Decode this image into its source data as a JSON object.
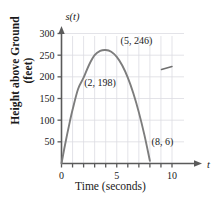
{
  "chart_data": {
    "type": "line",
    "title": "",
    "xlabel": "Time (seconds)",
    "ylabel": "Height above Ground (feet)",
    "y_axis_name": "s(t)",
    "x_axis_name": "t",
    "xlim": [
      0,
      11
    ],
    "ylim": [
      0,
      320
    ],
    "xticks": [
      0,
      1,
      2,
      3,
      4,
      5,
      6,
      7,
      8,
      9,
      10
    ],
    "xtick_labels": [
      "0",
      "",
      "",
      "",
      "",
      "5",
      "",
      "",
      "",
      "",
      "10"
    ],
    "yticks": [
      50,
      100,
      150,
      200,
      250,
      300
    ],
    "ytick_labels": [
      "50",
      "100",
      "150",
      "200",
      "250",
      "300"
    ],
    "grid": true,
    "legend": "none",
    "series": [
      {
        "name": "s(t)",
        "color": "#7d7d7d",
        "x": [
          0,
          0.25,
          0.5,
          0.75,
          1,
          1.5,
          2,
          2.5,
          3,
          3.5,
          4,
          4.5,
          5,
          5.5,
          6,
          6.5,
          7,
          7.5,
          8
        ],
        "values": [
          0,
          34,
          66,
          96,
          124,
          172,
          198,
          228,
          250,
          260,
          262,
          258,
          246,
          226,
          198,
          162,
          118,
          66,
          6
        ]
      }
    ],
    "annotations": [
      {
        "name": "point-2-198",
        "label": "(2, 198)",
        "x": 2,
        "y": 198,
        "label_x": 2.05,
        "label_y": 178
      },
      {
        "name": "point-5-246",
        "label": "(5, 246)",
        "x": 5,
        "y": 246,
        "label_x": 5.35,
        "label_y": 275
      },
      {
        "name": "point-8-6",
        "label": "(8, 6)",
        "x": 8,
        "y": 6,
        "label_x": 8.15,
        "label_y": 42
      }
    ],
    "stray_mark": {
      "name": "stray-dash-mark",
      "x1": 9.05,
      "y1": 217,
      "x2": 10.0,
      "y2": 224
    }
  },
  "axis": {
    "y_name": "s(t)",
    "x_name": "t",
    "x_title": "Time (seconds)",
    "y_title_line1": "Height above Ground",
    "y_title_line2": "(feet)"
  },
  "colors": {
    "curve": "#7d7d7d",
    "axis": "#5a5a5a",
    "grid": "#dcdce2",
    "text": "#1a1a1a",
    "background": "#ffffff"
  }
}
